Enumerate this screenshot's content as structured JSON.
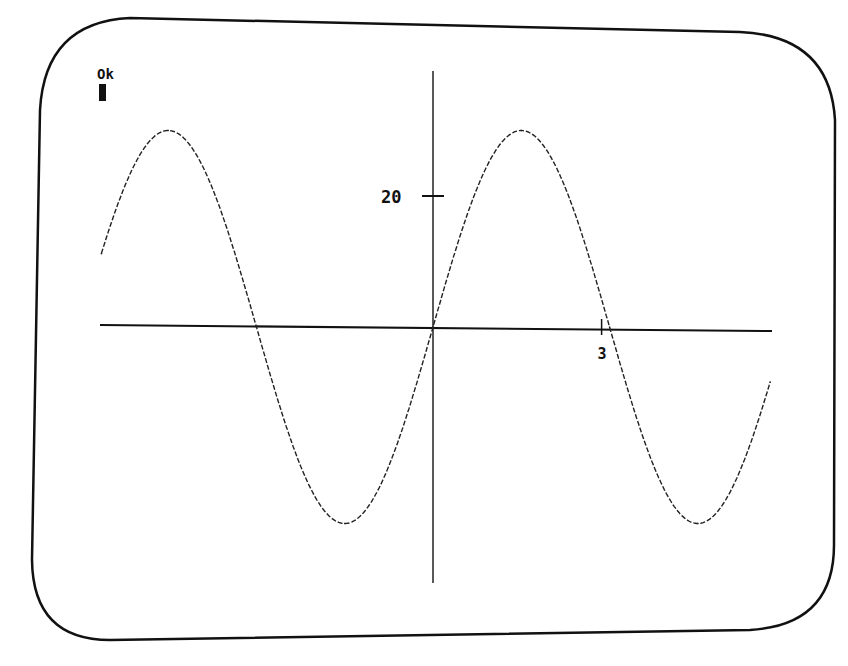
{
  "screen": {
    "prompt_text": "Ok",
    "cursor": "block-cursor",
    "foreground_color": "#111111",
    "background_color": "#ffffff"
  },
  "chart_data": {
    "type": "line",
    "title": "",
    "xlabel": "",
    "ylabel": "",
    "function": "y = 30*sin(x)",
    "series": [
      {
        "name": "sine curve",
        "style": "dashed",
        "amplitude": 30,
        "period": 6.2832,
        "x": [
          -5.9,
          -4.712,
          -3.1416,
          -1.5708,
          0,
          1.5708,
          3.1416,
          4.712,
          6.0
        ],
        "y": [
          11.2,
          30,
          0,
          -30,
          0,
          30,
          0,
          -30,
          -8.4
        ]
      }
    ],
    "xlim": [
      -5.9,
      6.0
    ],
    "ylim": [
      -40,
      40
    ],
    "x_ticks": [
      {
        "value": 3,
        "label": "3"
      }
    ],
    "y_ticks": [
      {
        "value": 20,
        "label": "20"
      }
    ],
    "grid": false,
    "legend": "none"
  }
}
